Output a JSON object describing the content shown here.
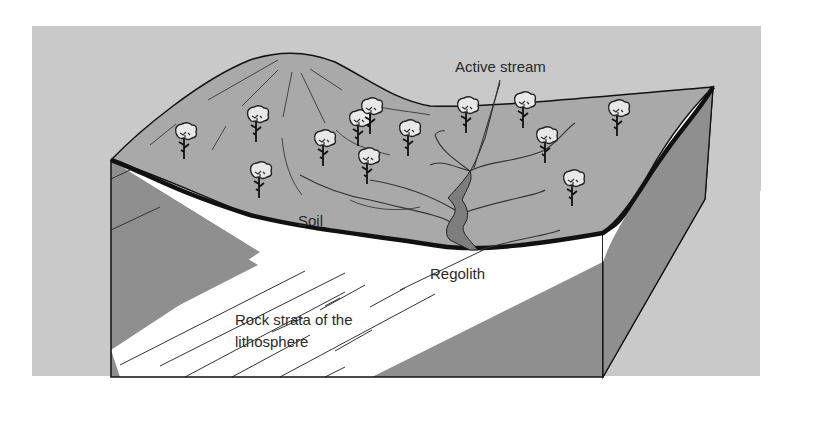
{
  "figure": {
    "type": "block-diagram",
    "colors": {
      "background_panel": "#c9c9c9",
      "land_surface": "#a9a9a9",
      "rock_mass": "#8f8f8f",
      "regolith": "#ffffff",
      "soil_line": "#111111",
      "stream": "#7d7d7d"
    },
    "labels": {
      "active_stream": "Active stream",
      "soil": "Soil",
      "regolith": "Regolith",
      "rock_line1": "Rock strata of the",
      "rock_line2": "lithosphere"
    },
    "tree_count": 14
  }
}
